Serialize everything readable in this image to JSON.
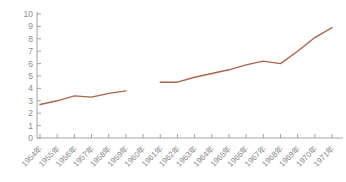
{
  "chart_data": {
    "type": "line",
    "title": "",
    "xlabel": "",
    "ylabel": "",
    "categories": [
      "1954年",
      "1955年",
      "1956年",
      "1957年",
      "1958年",
      "1959年",
      "1960年",
      "1961年",
      "1962年",
      "1963年",
      "1964年",
      "1965年",
      "1966年",
      "1967年",
      "1968年",
      "1969年",
      "1970年",
      "1971年"
    ],
    "series": [
      {
        "name": "value",
        "values": [
          2.7,
          3.0,
          3.4,
          3.3,
          3.6,
          3.8,
          null,
          4.5,
          4.5,
          4.9,
          5.2,
          5.5,
          5.9,
          6.2,
          6.0,
          7.0,
          8.1,
          8.9
        ],
        "color": "#ad644c"
      }
    ],
    "ylim": [
      0,
      10
    ],
    "yticks": [
      0,
      1,
      2,
      3,
      4,
      5,
      6,
      7,
      8,
      9,
      10
    ],
    "grid": false,
    "legend_position": "none",
    "x_label_rotation_deg": 45,
    "axis_color": "#a3a3a3",
    "tick_label_color": "#8c8c8c",
    "background_color": "#ffffff"
  }
}
